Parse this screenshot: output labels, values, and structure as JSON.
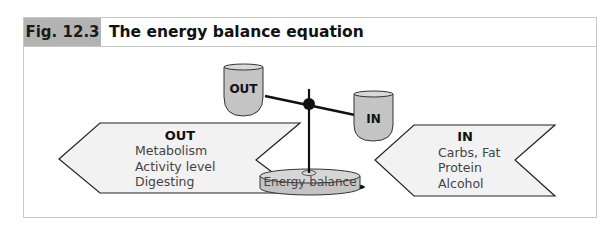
{
  "figure": {
    "label": "Fig. 12.3",
    "title": "The energy balance equation"
  },
  "diagram": {
    "left_arrow": {
      "heading": "OUT",
      "items": [
        "Metabolism",
        "Activity level",
        "Digesting"
      ]
    },
    "right_arrow": {
      "heading": "IN",
      "items": [
        "Carbs, Fat",
        "Protein",
        "Alcohol"
      ]
    },
    "scale": {
      "left_pan_label": "OUT",
      "right_pan_label": "IN",
      "base_label": "Energy balance"
    },
    "colors": {
      "label_bg": "#b3b3b3",
      "pan_fill": "#c4c4c4",
      "arrow_fill": "#f2f2f2",
      "frame": "#c8c8c8"
    }
  }
}
